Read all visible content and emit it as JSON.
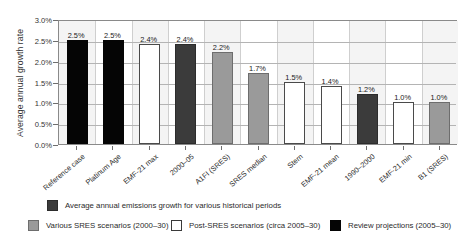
{
  "chart_data": {
    "type": "bar",
    "title": "",
    "subtitle": "",
    "xlabel": "",
    "ylabel": "Average annual growth rate",
    "ylim": [
      0.0,
      3.0
    ],
    "ytick_labels": [
      "0.0%",
      "0.5%",
      "1.0%",
      "1.5%",
      "2.0%",
      "2.5%",
      "3.0%"
    ],
    "ytick_values": [
      0.0,
      0.5,
      1.0,
      1.5,
      2.0,
      2.5,
      3.0
    ],
    "grid": true,
    "legend_position": "below",
    "categories": [
      "Reference case",
      "Platinum Age",
      "EMF-21 max",
      "2000–05",
      "A1FI (SRES)",
      "SRES median",
      "Stern",
      "EMF-21 mean",
      "1990–2000",
      "EMF-21 min",
      "B1 (SRES)"
    ],
    "values": [
      2.5,
      2.5,
      2.4,
      2.4,
      2.2,
      1.7,
      1.5,
      1.4,
      1.2,
      1.0,
      1.0
    ],
    "data_labels": [
      "2.5%",
      "2.5%",
      "2.4%",
      "2.4%",
      "2.2%",
      "1.7%",
      "1.5%",
      "1.4%",
      "1.2%",
      "1.0%",
      "1.0%"
    ],
    "bar_styles": [
      "black",
      "black",
      "white",
      "dark",
      "gray",
      "gray",
      "white",
      "white",
      "dark",
      "white",
      "gray"
    ],
    "series_group": [
      "Review projections (2005–30)",
      "Review projections (2005–30)",
      "Post-SRES scenarios (circa 2005–30)",
      "Average annual emissions growth for various historical periods",
      "Various SRES scenarios (2000–30)",
      "Various SRES scenarios (2000–30)",
      "Post-SRES scenarios (circa 2005–30)",
      "Post-SRES scenarios (circa 2005–30)",
      "Average annual emissions growth for various historical periods",
      "Post-SRES scenarios (circa 2005–30)",
      "Various SRES scenarios (2000–30)"
    ]
  },
  "legend": {
    "items": [
      {
        "swatch": "dark",
        "label": "Average annual emissions growth for various historical periods"
      },
      {
        "swatch": "gray",
        "label": "Various SRES scenarios (2000–30)"
      },
      {
        "swatch": "white",
        "label": "Post-SRES scenarios (circa 2005–30)"
      },
      {
        "swatch": "black",
        "label": "Review projections (2005–30)"
      }
    ]
  },
  "colors": {
    "historical": "#3b3b3b",
    "sres": "#9a9a9a",
    "post_sres": "#ffffff",
    "review": "#050505",
    "axis": "#8a8a8a",
    "grid": "#b4b4b4"
  }
}
